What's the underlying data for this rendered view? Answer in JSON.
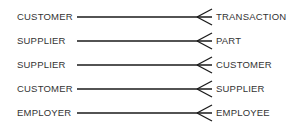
{
  "diagram": {
    "notation": "one-to-many (crow's foot)",
    "relationships": [
      {
        "left": "CUSTOMER",
        "right": "TRANSACTION",
        "line_start_x": 77
      },
      {
        "left": "SUPPLIER",
        "right": "PART",
        "line_start_x": 77
      },
      {
        "left": "SUPPLIER",
        "right": "CUSTOMER",
        "line_start_x": 77
      },
      {
        "left": "CUSTOMER",
        "right": "SUPPLIER",
        "line_start_x": 77
      },
      {
        "left": "EMPLOYER",
        "right": "EMPLOYEE",
        "line_start_x": 77
      }
    ],
    "line_color": "#1a1a1a",
    "text_color": "#333333"
  }
}
